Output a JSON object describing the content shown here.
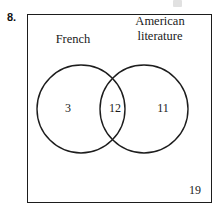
{
  "problem": {
    "number_label": "8."
  },
  "diagram": {
    "type": "venn-two-set",
    "universal_set_count": "19",
    "sets": [
      {
        "id": "french",
        "caption": "French",
        "only_count": "3"
      },
      {
        "id": "american-literature",
        "caption": "American\nliterature",
        "only_count": "11"
      }
    ],
    "intersection_count": "12",
    "colors": {
      "stroke": "#1d1d1d",
      "text": "#1a1a1a",
      "background": "#ffffff"
    }
  }
}
